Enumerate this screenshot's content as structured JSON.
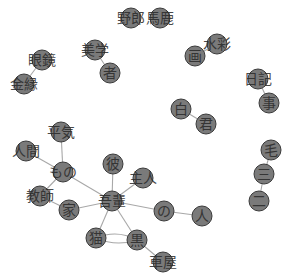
{
  "diagram": {
    "type": "co-occurrence network",
    "width": 289,
    "height": 279,
    "colors": {
      "background": "#ffffff",
      "node_fill": "#7a7a7a",
      "node_stroke": "#3a3a3a",
      "edge": "#a8a8a8",
      "label": "#2a2a2a"
    },
    "nodes": [
      {
        "id": "yarou",
        "label": "野郎",
        "x": 131,
        "y": 18,
        "r": 10
      },
      {
        "id": "baka",
        "label": "馬鹿",
        "x": 160,
        "y": 18,
        "r": 10
      },
      {
        "id": "megane",
        "label": "眼鏡",
        "x": 42,
        "y": 60,
        "r": 10
      },
      {
        "id": "kinbuchi",
        "label": "金縁",
        "x": 24,
        "y": 84,
        "r": 10
      },
      {
        "id": "bigaku",
        "label": "美学",
        "x": 95,
        "y": 50,
        "r": 10
      },
      {
        "id": "sha",
        "label": "者",
        "x": 110,
        "y": 73,
        "r": 10
      },
      {
        "id": "suisai",
        "label": "水彩",
        "x": 217,
        "y": 44,
        "r": 10
      },
      {
        "id": "ga",
        "label": "画",
        "x": 195,
        "y": 56,
        "r": 10
      },
      {
        "id": "nikki",
        "label": "日記",
        "x": 258,
        "y": 79,
        "r": 10
      },
      {
        "id": "ji",
        "label": "事",
        "x": 269,
        "y": 103,
        "r": 10
      },
      {
        "id": "shiro",
        "label": "白",
        "x": 181,
        "y": 109,
        "r": 10
      },
      {
        "id": "kun",
        "label": "君",
        "x": 206,
        "y": 124,
        "r": 10
      },
      {
        "id": "ke",
        "label": "毛",
        "x": 271,
        "y": 150,
        "r": 10
      },
      {
        "id": "san",
        "label": "三",
        "x": 264,
        "y": 174,
        "r": 10
      },
      {
        "id": "ni",
        "label": "二",
        "x": 259,
        "y": 201,
        "r": 10
      },
      {
        "id": "heiki",
        "label": "平気",
        "x": 61,
        "y": 132,
        "r": 10
      },
      {
        "id": "ningen",
        "label": "人間",
        "x": 26,
        "y": 151,
        "r": 10
      },
      {
        "id": "mono",
        "label": "もの",
        "x": 63,
        "y": 172,
        "r": 10
      },
      {
        "id": "kyoshi",
        "label": "教師",
        "x": 40,
        "y": 196,
        "r": 10
      },
      {
        "id": "ie",
        "label": "家",
        "x": 69,
        "y": 210,
        "r": 10
      },
      {
        "id": "kare",
        "label": "彼",
        "x": 113,
        "y": 164,
        "r": 10
      },
      {
        "id": "shujin",
        "label": "主人",
        "x": 143,
        "y": 178,
        "r": 10
      },
      {
        "id": "wagahai",
        "label": "吾輩",
        "x": 112,
        "y": 201,
        "r": 10
      },
      {
        "id": "no",
        "label": "の",
        "x": 164,
        "y": 211,
        "r": 10
      },
      {
        "id": "hito",
        "label": "人",
        "x": 202,
        "y": 216,
        "r": 10
      },
      {
        "id": "neko",
        "label": "猫",
        "x": 96,
        "y": 238,
        "r": 10
      },
      {
        "id": "kuro",
        "label": "黒",
        "x": 137,
        "y": 240,
        "r": 10
      },
      {
        "id": "kurumaya",
        "label": "車屋",
        "x": 163,
        "y": 262,
        "r": 10
      }
    ],
    "edges": [
      {
        "from": "megane",
        "to": "kinbuchi"
      },
      {
        "from": "bigaku",
        "to": "sha"
      },
      {
        "from": "suisai",
        "to": "ga"
      },
      {
        "from": "nikki",
        "to": "ji"
      },
      {
        "from": "shiro",
        "to": "kun"
      },
      {
        "from": "ke",
        "to": "san"
      },
      {
        "from": "san",
        "to": "ni"
      },
      {
        "from": "heiki",
        "to": "mono"
      },
      {
        "from": "ningen",
        "to": "mono"
      },
      {
        "from": "mono",
        "to": "kyoshi"
      },
      {
        "from": "mono",
        "to": "wagahai"
      },
      {
        "from": "kyoshi",
        "to": "ie"
      },
      {
        "from": "ie",
        "to": "wagahai"
      },
      {
        "from": "kare",
        "to": "wagahai"
      },
      {
        "from": "shujin",
        "to": "wagahai"
      },
      {
        "from": "wagahai",
        "to": "no"
      },
      {
        "from": "no",
        "to": "hito"
      },
      {
        "from": "wagahai",
        "to": "neko"
      },
      {
        "from": "wagahai",
        "to": "kuro"
      },
      {
        "from": "neko",
        "to": "kuro",
        "curve": -10
      },
      {
        "from": "neko",
        "to": "kuro",
        "curve": 8
      },
      {
        "from": "kuro",
        "to": "kurumaya"
      }
    ]
  }
}
